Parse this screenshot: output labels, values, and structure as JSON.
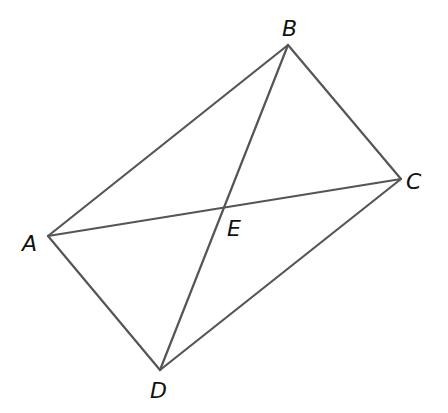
{
  "figure": {
    "type": "quadrilateral-with-diagonals",
    "stroke_color": "#555555",
    "label_color": "#111111",
    "points": {
      "A": {
        "label": "A",
        "x": 48,
        "y": 236,
        "lx": 22,
        "ly": 251
      },
      "B": {
        "label": "B",
        "x": 288,
        "y": 45,
        "lx": 282,
        "ly": 36
      },
      "C": {
        "label": "C",
        "x": 401,
        "y": 179,
        "lx": 406,
        "ly": 189
      },
      "D": {
        "label": "D",
        "x": 160,
        "y": 370,
        "lx": 150,
        "ly": 398
      },
      "E": {
        "label": "E",
        "x": 225,
        "y": 209,
        "lx": 227,
        "ly": 236
      }
    },
    "segments": [
      {
        "name": "AB",
        "from": "A",
        "to": "B"
      },
      {
        "name": "BC",
        "from": "B",
        "to": "C"
      },
      {
        "name": "CD",
        "from": "C",
        "to": "D"
      },
      {
        "name": "DA",
        "from": "D",
        "to": "A"
      },
      {
        "name": "AC",
        "from": "A",
        "to": "C"
      },
      {
        "name": "BD",
        "from": "B",
        "to": "D"
      }
    ]
  }
}
